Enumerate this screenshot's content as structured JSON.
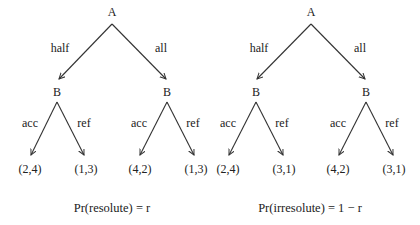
{
  "trees": [
    {
      "root": "A",
      "root_actions": [
        "half",
        "all"
      ],
      "children": [
        {
          "node": "B",
          "actions": [
            "acc",
            "ref"
          ],
          "payoffs": [
            "(2,4)",
            "(1,3)"
          ]
        },
        {
          "node": "B",
          "actions": [
            "acc",
            "ref"
          ],
          "payoffs": [
            "(4,2)",
            "(1,3)"
          ]
        }
      ],
      "caption": "Pr(resolute) = r"
    },
    {
      "root": "A",
      "root_actions": [
        "half",
        "all"
      ],
      "children": [
        {
          "node": "B",
          "actions": [
            "acc",
            "ref"
          ],
          "payoffs": [
            "(2,4)",
            "(3,1)"
          ]
        },
        {
          "node": "B",
          "actions": [
            "acc",
            "ref"
          ],
          "payoffs": [
            "(4,2)",
            "(3,1)"
          ]
        }
      ],
      "caption": "Pr(irresolute) = 1 − r"
    }
  ]
}
